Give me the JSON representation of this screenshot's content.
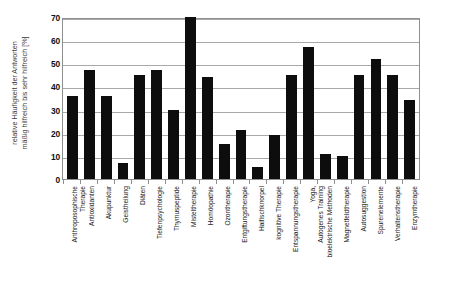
{
  "chart_data": {
    "type": "bar",
    "title": "",
    "xlabel": "",
    "ylabel": "relative Häufigkeit der Antworten mäßig hilfreich bis sehr hilfreich [%]",
    "ylabel_lines": [
      "relative Häufigkeit der Antworten",
      "mäßig hilfreich bis sehr hilfreich [%]"
    ],
    "ylim": [
      0,
      70
    ],
    "ytick_step": 10,
    "yticks": [
      70,
      60,
      50,
      40,
      30,
      20,
      10,
      0
    ],
    "ytick_labels": [
      "70",
      "60",
      "50",
      "40",
      "30",
      "20",
      "10",
      "0"
    ],
    "grid": true,
    "legend": "none",
    "bar_color": "#0d0d0d",
    "axis_color": "#8f8f8f",
    "gridline_color": "#a8a8a8",
    "categories": [
      "Anthroposophische Therapie",
      "Antioxidanten",
      "Akupunktur",
      "Geistheilung",
      "Diäten",
      "Tiefenpsychologie",
      "Thymuspeptide",
      "Misteltherapie",
      "Homöopathie",
      "Ozontherapie",
      "Entgiftungstherapie",
      "Haifischknorpel",
      "kognitive Therapie",
      "Entspannungstherapie",
      "Yoga, Autogenes Training",
      "bioelektrische Methoden",
      "Magnetfeldtherapie",
      "Autosuggestion",
      "Spurenelemente",
      "Verhaltenstherapie",
      "Enzymtherapie"
    ],
    "category_label_lines": [
      [
        "Anthroposophische",
        "Therapie"
      ],
      [
        "Antioxidanten"
      ],
      [
        "Akupunktur"
      ],
      [
        "Geistheilung"
      ],
      [
        "Diäten"
      ],
      [
        "Tiefenpsychologie"
      ],
      [
        "Thymuspeptide"
      ],
      [
        "Misteltherapie"
      ],
      [
        "Homöopathie"
      ],
      [
        "Ozontherapie"
      ],
      [
        "Entgiftungstherapie"
      ],
      [
        "Haifischknorpel"
      ],
      [
        "kognitive Therapie"
      ],
      [
        "Entspannungstherapie"
      ],
      [
        "Yoga,",
        "Autogenes Training"
      ],
      [
        "bioelektrische Methoden"
      ],
      [
        "Magnetfeldtherapie"
      ],
      [
        "Autosuggestion"
      ],
      [
        "Spurenelemente"
      ],
      [
        "Verhaltenstherapie"
      ],
      [
        "Enzymtherapie"
      ]
    ],
    "values": [
      36,
      47,
      36,
      7,
      45,
      47,
      30,
      70,
      44,
      15,
      21,
      5,
      19,
      45,
      57,
      11,
      10,
      45,
      52,
      45,
      34
    ]
  }
}
